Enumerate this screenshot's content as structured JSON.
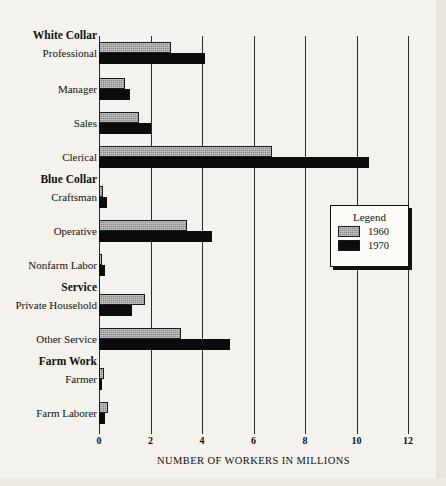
{
  "chart_data": {
    "type": "bar",
    "orientation": "horizontal",
    "title": "",
    "xlabel": "NUMBER OF WORKERS IN MILLIONS",
    "ylabel": "",
    "xlim": [
      0,
      12
    ],
    "xticks": [
      0,
      2,
      4,
      6,
      8,
      10,
      12
    ],
    "xtick_labels": [
      "0",
      "2",
      "4",
      "6",
      "8",
      "10",
      "12"
    ],
    "grid": "vertical",
    "legend_position": "center-right",
    "legend_title": "Legend",
    "categories": [
      "Professional",
      "Manager",
      "Sales",
      "Clerical",
      "Craftsman",
      "Operative",
      "Nonfarm Labor",
      "Private Household",
      "Other Service",
      "Farmer",
      "Farm Laborer"
    ],
    "group_headers": [
      {
        "label": "White Collar",
        "before_category": "Professional"
      },
      {
        "label": "Blue Collar",
        "before_category": "Craftsman"
      },
      {
        "label": "Service",
        "before_category": "Private Household"
      },
      {
        "label": "Farm Work",
        "before_category": "Farmer"
      }
    ],
    "series": [
      {
        "name": "1960",
        "color": "#8d8d8d",
        "values": [
          2.8,
          1.0,
          1.55,
          6.7,
          0.15,
          3.4,
          0.1,
          1.8,
          3.2,
          0.2,
          0.35
        ]
      },
      {
        "name": "1970",
        "color": "#0c0c0c",
        "values": [
          4.1,
          1.2,
          2.0,
          10.5,
          0.3,
          4.4,
          0.25,
          1.3,
          5.1,
          0.1,
          0.25
        ]
      }
    ]
  },
  "rows": [
    {
      "label": "Professional",
      "header": "White Collar",
      "top": 6,
      "v1960": 2.8,
      "v1970": 4.1
    },
    {
      "label": "Manager",
      "header": "",
      "top": 42,
      "v1960": 1.0,
      "v1970": 1.2
    },
    {
      "label": "Sales",
      "header": "",
      "top": 76,
      "v1960": 1.55,
      "v1970": 2.0
    },
    {
      "label": "Clerical",
      "header": "",
      "top": 110,
      "v1960": 6.7,
      "v1970": 10.5
    },
    {
      "label": "Craftsman",
      "header": "Blue Collar",
      "top": 150,
      "v1960": 0.15,
      "v1970": 0.3
    },
    {
      "label": "Operative",
      "header": "",
      "top": 184,
      "v1960": 3.4,
      "v1970": 4.4
    },
    {
      "label": "Nonfarm Labor",
      "header": "",
      "top": 218,
      "v1960": 0.1,
      "v1970": 0.25
    },
    {
      "label": "Private Household",
      "header": "Service",
      "top": 258,
      "v1960": 1.8,
      "v1970": 1.3
    },
    {
      "label": "Other Service",
      "header": "",
      "top": 292,
      "v1960": 3.2,
      "v1970": 5.1
    },
    {
      "label": "Farmer",
      "header": "Farm Work",
      "top": 332,
      "v1960": 0.2,
      "v1970": 0.1
    },
    {
      "label": "Farm Laborer",
      "header": "",
      "top": 366,
      "v1960": 0.35,
      "v1970": 0.25
    }
  ],
  "axis": {
    "title": "NUMBER OF WORKERS IN MILLIONS",
    "ticks": [
      "0",
      "2",
      "4",
      "6",
      "8",
      "10",
      "12"
    ]
  },
  "legend": {
    "title": "Legend",
    "entries": [
      {
        "label": "1960",
        "swatch": "gray"
      },
      {
        "label": "1970",
        "swatch": "black"
      }
    ]
  }
}
